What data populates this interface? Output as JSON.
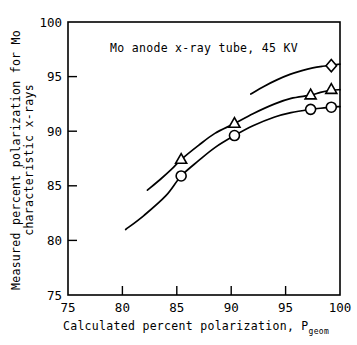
{
  "chart_data": {
    "type": "line",
    "title": "",
    "annotation": "Mo anode x-ray tube, 45 KV",
    "xlabel": "Calculated percent polarization, P",
    "xlabel_subscript": "geom",
    "ylabel_line1": "Measured percent polarization for Mo",
    "ylabel_line2": "characteristic x-rays",
    "xlim": [
      75,
      100
    ],
    "ylim": [
      75,
      100
    ],
    "xticks": [
      75,
      80,
      85,
      90,
      95,
      100
    ],
    "xtick_labels": [
      "75",
      "80",
      "85",
      "90",
      "95",
      "100"
    ],
    "yticks": [
      75,
      80,
      85,
      90,
      95,
      100
    ],
    "ytick_labels": [
      "75",
      "80",
      "85",
      "90",
      "95",
      "100"
    ],
    "grid": false,
    "legend": "none",
    "series": [
      {
        "name": "circle-series",
        "marker": "circle",
        "x": [
          85.4,
          90.3,
          97.3,
          99.2
        ],
        "values": [
          85.9,
          89.6,
          92.0,
          92.2
        ],
        "curve_x": [
          80.3,
          82.0,
          84.0,
          85.4,
          87.0,
          88.5,
          90.3,
          92.0,
          94.0,
          95.5,
          97.3,
          98.2,
          99.2,
          100.0
        ],
        "curve_y": [
          81.0,
          82.3,
          84.1,
          85.9,
          87.3,
          88.5,
          89.6,
          90.5,
          91.3,
          91.7,
          92.0,
          92.1,
          92.2,
          92.25
        ]
      },
      {
        "name": "triangle-series",
        "marker": "triangle",
        "x": [
          85.4,
          90.3,
          97.3,
          99.2
        ],
        "values": [
          87.4,
          90.7,
          93.3,
          93.8
        ],
        "curve_x": [
          82.3,
          83.5,
          84.5,
          85.4,
          87.0,
          88.5,
          90.3,
          92.0,
          94.0,
          95.5,
          97.3,
          98.2,
          99.2,
          100.0
        ],
        "curve_y": [
          84.6,
          85.6,
          86.5,
          87.4,
          88.7,
          89.8,
          90.7,
          91.6,
          92.5,
          93.0,
          93.3,
          93.55,
          93.75,
          93.8
        ]
      },
      {
        "name": "diamond-series",
        "marker": "diamond",
        "x": [
          99.2
        ],
        "values": [
          96.0
        ],
        "curve_x": [
          91.8,
          93.0,
          94.2,
          95.4,
          96.5,
          97.5,
          98.4,
          99.2,
          100.0
        ],
        "curve_y": [
          93.4,
          94.1,
          94.7,
          95.2,
          95.55,
          95.8,
          95.95,
          96.05,
          96.15
        ]
      }
    ]
  },
  "colors": {
    "axis": "#000000",
    "background": "#ffffff",
    "marker_fill": "#ffffff"
  }
}
